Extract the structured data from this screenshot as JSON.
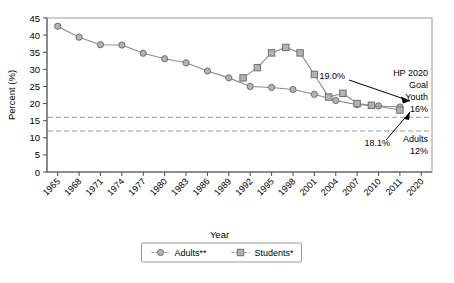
{
  "chart_data": {
    "type": "line",
    "title": "",
    "xlabel": "Year",
    "ylabel": "Percent (%)",
    "ylim": [
      0,
      45
    ],
    "ytick_step": 5,
    "yticks": [
      0,
      5,
      10,
      15,
      20,
      25,
      30,
      35,
      40,
      45
    ],
    "categories": [
      "1965",
      "1968",
      "1971",
      "1974",
      "1977",
      "1980",
      "1983",
      "1986",
      "1989",
      "1992",
      "1995",
      "1998",
      "2001",
      "2004",
      "2007",
      "2010",
      "2011",
      "2020"
    ],
    "grid": false,
    "legend_position": "bottom-center",
    "series": [
      {
        "name": "Adults**",
        "marker": "circle",
        "x": [
          1965,
          1968,
          1971,
          1974,
          1977,
          1980,
          1983,
          1986,
          1989,
          1992,
          1995,
          1998,
          2001,
          2004,
          2007,
          2010,
          2011
        ],
        "values": [
          42.6,
          39.4,
          37.2,
          37.1,
          34.7,
          33.1,
          31.9,
          29.5,
          27.5,
          25.0,
          24.7,
          24.1,
          22.7,
          20.9,
          19.7,
          19.3,
          19.0
        ]
      },
      {
        "name": "Students*",
        "marker": "square",
        "x": [
          1991,
          1993,
          1995,
          1997,
          1999,
          2001,
          2003,
          2005,
          2007,
          2009,
          2011
        ],
        "values": [
          27.5,
          30.5,
          34.8,
          36.4,
          34.8,
          28.5,
          21.9,
          23.0,
          20.0,
          19.5,
          18.1
        ]
      }
    ],
    "reference_lines": [
      {
        "label": "Youth goal",
        "value": 16,
        "style": "dashed"
      },
      {
        "label": "Adults goal",
        "value": 12,
        "style": "dashed"
      }
    ],
    "annotations": [
      {
        "name": "adults-endpoint-label",
        "text": "19.0%"
      },
      {
        "name": "students-endpoint-label",
        "text": "18.1%"
      },
      {
        "name": "hp-goal-line1",
        "text": "HP 2020"
      },
      {
        "name": "hp-goal-line2",
        "text": "Goal"
      },
      {
        "name": "hp-goal-youth-label",
        "text": "Youth"
      },
      {
        "name": "hp-goal-youth-value",
        "text": "16%"
      },
      {
        "name": "hp-goal-adults-label",
        "text": "Adults"
      },
      {
        "name": "hp-goal-adults-value",
        "text": "12%"
      }
    ]
  },
  "legend": {
    "items": [
      {
        "label": "Adults**",
        "marker": "circle"
      },
      {
        "label": "Students*",
        "marker": "square"
      }
    ]
  },
  "colors": {
    "marker_fill": "#b3b3b3",
    "marker_stroke": "#6e6e6e",
    "series_line": "#8a8a8a",
    "axis": "#4d4d4d",
    "goal_line": "#9a9a9a",
    "text": "#000000"
  }
}
